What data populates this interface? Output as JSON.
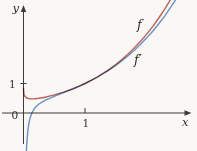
{
  "figure": {
    "background_color": "#f9f8f4",
    "axis_color": "#3b3b3b",
    "text_color": "#2e2e2e"
  },
  "chart_data": {
    "type": "line",
    "title": "",
    "xlabel": "x",
    "ylabel": "y",
    "origin_label": "0",
    "grid": false,
    "legend": "inline curve labels",
    "xlim": [
      -0.382,
      2.821
    ],
    "ylim": [
      -1.288,
      3.831
    ],
    "x_ticks": [
      {
        "value": 1,
        "label": "1"
      }
    ],
    "y_ticks": [
      {
        "value": 1,
        "label": "1"
      }
    ],
    "series": [
      {
        "name": "f",
        "label": "f",
        "color": "#c4635e",
        "points": [
          [
            0.0005,
            0.844
          ],
          [
            0.001,
            0.804
          ],
          [
            0.002,
            0.758
          ],
          [
            0.005,
            0.688
          ],
          [
            0.01,
            0.631
          ],
          [
            0.02,
            0.575
          ],
          [
            0.04,
            0.525
          ],
          [
            0.07,
            0.495
          ],
          [
            0.1,
            0.483
          ],
          [
            0.135,
            0.479
          ],
          [
            0.18,
            0.483
          ],
          [
            0.25,
            0.5
          ],
          [
            0.35,
            0.537
          ],
          [
            0.5,
            0.613
          ],
          [
            0.65,
            0.707
          ],
          [
            0.8,
            0.819
          ],
          [
            0.9,
            0.905
          ],
          [
            1.0,
            1.0
          ],
          [
            1.1,
            1.105
          ],
          [
            1.2,
            1.221
          ],
          [
            1.3,
            1.349
          ],
          [
            1.4,
            1.489
          ],
          [
            1.5,
            1.643
          ],
          [
            1.6,
            1.812
          ],
          [
            1.7,
            1.997
          ],
          [
            1.8,
            2.2
          ],
          [
            1.9,
            2.423
          ],
          [
            2.0,
            2.665
          ],
          [
            2.1,
            2.93
          ],
          [
            2.2,
            3.22
          ],
          [
            2.3,
            3.537
          ],
          [
            2.4,
            3.882
          ],
          [
            2.5,
            4.258
          ],
          [
            2.6,
            4.668
          ]
        ]
      },
      {
        "name": "f-prime",
        "label": "f′",
        "color": "#6e96cd",
        "points": [
          [
            0.028,
            -2.59
          ],
          [
            0.033,
            -2.09
          ],
          [
            0.04,
            -1.6
          ],
          [
            0.05,
            -1.14
          ],
          [
            0.06,
            -0.833
          ],
          [
            0.07,
            -0.616
          ],
          [
            0.085,
            -0.389
          ],
          [
            0.1,
            -0.231
          ],
          [
            0.135,
            0.0
          ],
          [
            0.18,
            0.162
          ],
          [
            0.25,
            0.307
          ],
          [
            0.35,
            0.431
          ],
          [
            0.5,
            0.566
          ],
          [
            0.65,
            0.688
          ],
          [
            0.8,
            0.814
          ],
          [
            0.9,
            0.904
          ],
          [
            1.0,
            1.0
          ],
          [
            1.1,
            1.104
          ],
          [
            1.2,
            1.216
          ],
          [
            1.3,
            1.338
          ],
          [
            1.4,
            1.47
          ],
          [
            1.5,
            1.614
          ],
          [
            1.6,
            1.769
          ],
          [
            1.7,
            1.938
          ],
          [
            1.8,
            2.122
          ],
          [
            1.9,
            2.322
          ],
          [
            2.0,
            2.538
          ],
          [
            2.1,
            2.772
          ],
          [
            2.2,
            3.027
          ],
          [
            2.3,
            3.303
          ],
          [
            2.4,
            3.603
          ],
          [
            2.5,
            3.927
          ],
          [
            2.6,
            4.278
          ]
        ]
      }
    ]
  }
}
